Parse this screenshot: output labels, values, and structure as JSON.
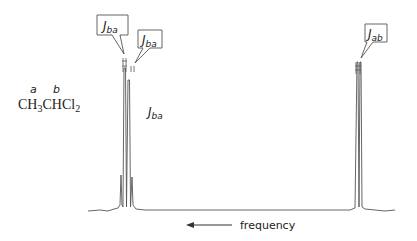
{
  "molecule": {
    "label_a": "a",
    "label_b": "b",
    "formula_parts": [
      "CH",
      "3",
      "CHCl",
      "2"
    ]
  },
  "callouts": {
    "left_1": {
      "J": "J",
      "sub": "ba"
    },
    "left_2": {
      "J": "J",
      "sub": "ba"
    },
    "right": {
      "J": "J",
      "sub": "ab"
    },
    "inline": {
      "J": "J",
      "sub": "ba"
    }
  },
  "axis": {
    "arrow_label": "frequency"
  },
  "colors": {
    "line": "#555555",
    "text": "#222222"
  }
}
